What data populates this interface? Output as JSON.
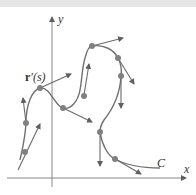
{
  "figure": {
    "axes": {
      "x_label": "x",
      "y_label": "y"
    },
    "curve_label": "C",
    "vector_label_bold": "r",
    "vector_label_rest": "′(s)",
    "colors": {
      "curve": "#707070",
      "axis": "#888888",
      "point": "#808080",
      "arrow": "#6a6a6a",
      "topband": "#e6e6e6"
    },
    "points": [
      {
        "x": 25,
        "y": 152,
        "tangent": [
          -8,
          20,
          14,
          -44
        ]
      },
      {
        "x": 26,
        "y": 123,
        "tangent": [
          0,
          0,
          -3,
          -25
        ]
      },
      {
        "x": 40,
        "y": 88,
        "tangent": [
          0,
          0,
          31,
          -14
        ]
      },
      {
        "x": 63,
        "y": 108,
        "tangent": [
          0,
          0,
          30,
          14
        ]
      },
      {
        "x": 92,
        "y": 46,
        "tangent": [
          0,
          0,
          31,
          -8
        ]
      },
      {
        "x": 118,
        "y": 58,
        "tangent": [
          0,
          0,
          15,
          26
        ]
      },
      {
        "x": 121,
        "y": 76,
        "tangent": [
          0,
          0,
          0,
          32
        ]
      },
      {
        "x": 90,
        "y": 64,
        "tangent": [
          -6,
          30,
          0,
          -31
        ]
      },
      {
        "x": 100,
        "y": 132,
        "tangent": [
          0,
          0,
          0,
          34
        ]
      },
      {
        "x": 115,
        "y": 159,
        "tangent": [
          0,
          0,
          20,
          10
        ]
      }
    ]
  }
}
